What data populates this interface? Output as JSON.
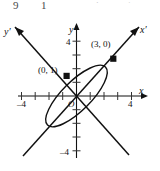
{
  "figure": {
    "type": "math-coordinate-plot",
    "top_cut_text": {
      "frag_left": "9",
      "frag_mid": "1",
      "frag_right_1": "·",
      "frag_right_2": "·"
    },
    "axes": {
      "x_label": "x",
      "y_label": "y",
      "x_prime_label": "x′",
      "y_prime_label": "y′",
      "origin_label": "O",
      "x_ticks": [
        {
          "value": -4,
          "label": "–4",
          "show_label": true
        },
        {
          "value": -3,
          "label": "",
          "show_label": false
        },
        {
          "value": -2,
          "label": "",
          "show_label": false
        },
        {
          "value": -1,
          "label": "",
          "show_label": false
        },
        {
          "value": 1,
          "label": "",
          "show_label": false
        },
        {
          "value": 2,
          "label": "",
          "show_label": false
        },
        {
          "value": 3,
          "label": "",
          "show_label": false
        },
        {
          "value": 4,
          "label": "4",
          "show_label": true
        }
      ],
      "y_ticks": [
        {
          "value": 4,
          "label": "4",
          "show_label": true
        },
        {
          "value": 3,
          "label": "",
          "show_label": false
        },
        {
          "value": 2,
          "label": "",
          "show_label": false
        },
        {
          "value": 1,
          "label": "",
          "show_label": false
        },
        {
          "value": -1,
          "label": "",
          "show_label": false
        },
        {
          "value": -2,
          "label": "",
          "show_label": false
        },
        {
          "value": -3,
          "label": "",
          "show_label": false
        },
        {
          "value": -4,
          "label": "–4",
          "show_label": true
        }
      ],
      "x_range": [
        -4.6,
        4.6
      ],
      "y_range": [
        -4.6,
        4.6
      ],
      "rotation_degrees": 45
    },
    "points": [
      {
        "label": "(3, 0)",
        "x": 2.45,
        "y": 2.45,
        "marker": "square"
      },
      {
        "label": "(0, 1)",
        "x": -0.72,
        "y": 0.72,
        "marker": "square"
      }
    ],
    "ellipse": {
      "semi_major": 3.0,
      "semi_minor": 1.0,
      "rotation_degrees": 45,
      "center_x": 0,
      "center_y": 0
    },
    "colors": {
      "stroke": "#111111",
      "background": "#ffffff",
      "tick": "#444444"
    }
  }
}
